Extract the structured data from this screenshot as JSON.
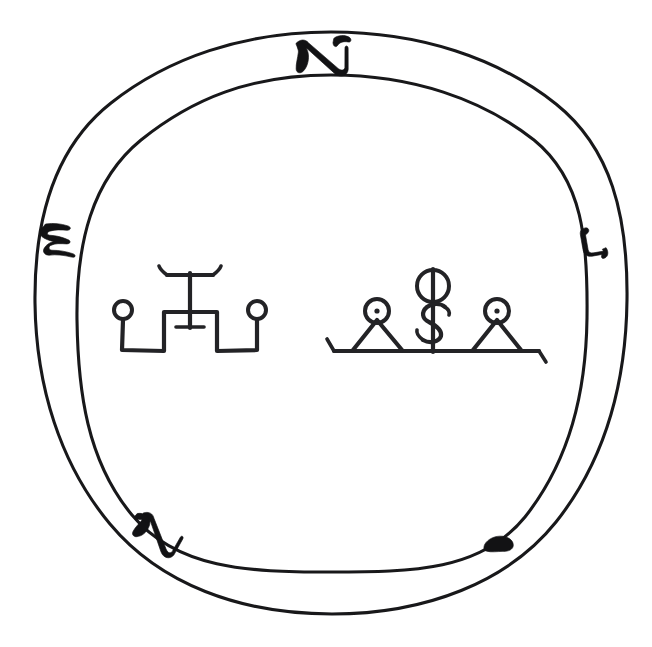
{
  "document": {
    "title": "Magical Seal Diagram",
    "kind": "occult-seal",
    "background_color": "#ffffff",
    "ink_color": "#18181a",
    "width": 652,
    "height": 647
  },
  "ring": {
    "name": "double-circle-band",
    "outer_circle": {
      "cx": 331,
      "cy": 323,
      "rx": 296,
      "ry": 291
    },
    "inner_circle": {
      "cx": 331,
      "cy": 324,
      "rx": 255,
      "ry": 249
    },
    "stroke_color": "#18181a",
    "stroke_width": 3.1,
    "description": "Hand-drawn double concentric circle forming an annular band"
  },
  "ring_marks": [
    {
      "id": "mark-top",
      "label": "aleph",
      "position": "top",
      "angle_deg": 270,
      "cx": 322,
      "cy": 56,
      "rotation": -4,
      "size": 46,
      "description": "Hebrew letter Aleph drawn across the band at the top"
    },
    {
      "id": "mark-left",
      "label": "shin",
      "position": "left",
      "angle_deg": 185,
      "cx": 62,
      "cy": 238,
      "rotation": 72,
      "size": 40,
      "description": "Wavy Shin-like mark on the left of the band"
    },
    {
      "id": "mark-right",
      "label": "vav",
      "position": "right",
      "angle_deg": 8,
      "cx": 592,
      "cy": 243,
      "rotation": 78,
      "size": 34,
      "description": "Small hooked Vav-like mark on the right of the band"
    },
    {
      "id": "mark-bottom-left",
      "label": "aleph",
      "position": "bottom-left",
      "angle_deg": 118,
      "cx": 159,
      "cy": 533,
      "rotation": 28,
      "size": 42,
      "description": "Second Aleph drawn across the band at lower left"
    },
    {
      "id": "mark-bottom-right",
      "label": "yod",
      "position": "bottom-right",
      "angle_deg": 62,
      "cx": 499,
      "cy": 545,
      "rotation": -12,
      "size": 26,
      "description": "Small Yod-like tick on the band at lower right"
    }
  ],
  "sigils": [
    {
      "id": "sigil-left",
      "name": "crenel-and-tau-sigil",
      "center": {
        "x": 190,
        "y": 318
      },
      "components": [
        {
          "type": "circle-terminal",
          "side": "left",
          "cx": 123,
          "cy": 310,
          "r": 9
        },
        {
          "type": "circle-terminal",
          "side": "right",
          "cx": 257,
          "cy": 310,
          "r": 9
        },
        {
          "type": "crenel-path",
          "description": "Square bracket baseline rising to a central plateau"
        },
        {
          "type": "tau-staff",
          "description": "Tau / anchor with upswept arms and lower crossbar",
          "cx": 190,
          "top": 272,
          "bottom": 327
        }
      ]
    },
    {
      "id": "sigil-right",
      "name": "twin-peaks-and-staff-sigil",
      "center": {
        "x": 437,
        "y": 315
      },
      "components": [
        {
          "type": "baseline",
          "x1": 330,
          "x2": 540,
          "y": 351,
          "description": "Horizontal ground line with end ticks"
        },
        {
          "type": "triangle",
          "side": "left",
          "apex_x": 377,
          "apex_y": 318,
          "base_left": 352,
          "base_right": 404
        },
        {
          "type": "triangle",
          "side": "right",
          "apex_x": 497,
          "apex_y": 318,
          "base_left": 472,
          "base_right": 522
        },
        {
          "type": "dotted-circle",
          "side": "left",
          "cx": 377,
          "cy": 311,
          "r": 12
        },
        {
          "type": "dotted-circle",
          "side": "right",
          "cx": 497,
          "cy": 311,
          "r": 12
        },
        {
          "type": "staff",
          "cx": 433,
          "top": 268,
          "bottom": 352,
          "description": "Central vertical staff"
        },
        {
          "type": "crossed-circle",
          "cx": 433,
          "cy": 286,
          "r": 16,
          "description": "Circle pierced by the staff"
        },
        {
          "type": "serpent-s",
          "cx": 433,
          "cy": 323,
          "description": "S / dollar-sign serpent around the staff"
        }
      ]
    }
  ]
}
